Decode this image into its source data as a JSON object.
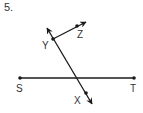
{
  "problem": {
    "number": "5."
  },
  "diagram": {
    "stroke_color": "#1a1a1a",
    "label_color": "#333333",
    "points": {
      "S": {
        "label": "S",
        "x": 20,
        "y": 78
      },
      "T": {
        "label": "T",
        "x": 134,
        "y": 78
      },
      "Y": {
        "label": "Y",
        "x": 53,
        "y": 39
      },
      "Z": {
        "label": "Z",
        "x": 77,
        "y": 26
      },
      "X": {
        "label": "X",
        "x": 86,
        "y": 93
      }
    },
    "figures": [
      {
        "type": "segment",
        "name": "ST",
        "from": "S",
        "to": "T"
      },
      {
        "type": "line",
        "name": "YX",
        "through": [
          "Y",
          "X"
        ]
      },
      {
        "type": "ray",
        "name": "YZ",
        "from": "Y",
        "through": "Z"
      }
    ]
  }
}
